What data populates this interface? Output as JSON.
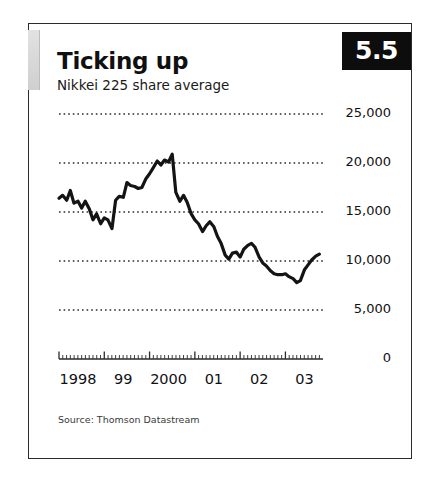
{
  "figure": {
    "badge": "5.5",
    "title": "Ticking up",
    "subtitle": "Nikkei 225 share average",
    "source": "Source: Thomson Datastream"
  },
  "chart_data": {
    "type": "line",
    "title": "Ticking up",
    "subtitle": "Nikkei 225 share average",
    "xlabel": "",
    "ylabel": "",
    "source": "Thomson Datastream",
    "grid": true,
    "legend": false,
    "xlim": [
      1998.0,
      2003.83
    ],
    "ylim": [
      0,
      25000
    ],
    "y_ticks": [
      0,
      5000,
      10000,
      15000,
      20000,
      25000
    ],
    "y_tick_labels": [
      "0",
      "5,000",
      "10,000",
      "15,000",
      "20,000",
      "25,000"
    ],
    "x_ticks": [
      1998,
      1999,
      2000,
      2001,
      2002,
      2003
    ],
    "x_tick_labels": [
      "1998",
      "99",
      "2000",
      "01",
      "02",
      "03"
    ],
    "x_minor_ticks_per_year": 12,
    "line_color": "#141414",
    "line_width": 3.2,
    "series": [
      {
        "name": "Nikkei 225 share average",
        "x": [
          1998.0,
          1998.08,
          1998.17,
          1998.25,
          1998.33,
          1998.42,
          1998.5,
          1998.58,
          1998.67,
          1998.75,
          1998.83,
          1998.92,
          1999.0,
          1999.08,
          1999.17,
          1999.25,
          1999.33,
          1999.42,
          1999.5,
          1999.58,
          1999.67,
          1999.75,
          1999.83,
          1999.92,
          2000.0,
          2000.08,
          2000.17,
          2000.25,
          2000.33,
          2000.42,
          2000.5,
          2000.58,
          2000.67,
          2000.75,
          2000.83,
          2000.92,
          2001.0,
          2001.08,
          2001.17,
          2001.25,
          2001.33,
          2001.42,
          2001.5,
          2001.58,
          2001.67,
          2001.75,
          2001.83,
          2001.92,
          2002.0,
          2002.08,
          2002.17,
          2002.25,
          2002.33,
          2002.42,
          2002.5,
          2002.58,
          2002.67,
          2002.75,
          2002.83,
          2002.92,
          2003.0,
          2003.08,
          2003.17,
          2003.25,
          2003.33,
          2003.42,
          2003.5,
          2003.58,
          2003.67,
          2003.75
        ],
        "y": [
          16400,
          16700,
          16200,
          17200,
          15900,
          16100,
          15400,
          16100,
          15300,
          14200,
          14800,
          13800,
          14400,
          14200,
          13300,
          16200,
          16600,
          16500,
          18000,
          17700,
          17600,
          17400,
          17500,
          18400,
          18900,
          19500,
          20200,
          19800,
          20300,
          20100,
          20900,
          17000,
          16100,
          16700,
          16000,
          14800,
          14200,
          13800,
          13000,
          13600,
          14000,
          13500,
          12500,
          11800,
          10600,
          10200,
          10800,
          10900,
          10400,
          11200,
          11600,
          11800,
          11400,
          10400,
          9800,
          9500,
          9000,
          8700,
          8600,
          8600,
          8700,
          8400,
          8200,
          7800,
          8000,
          9100,
          9600,
          10100,
          10500,
          10700
        ]
      }
    ]
  },
  "plot_geometry": {
    "x_left": 30,
    "x_right": 294,
    "y_top": 90,
    "y_bottom": 335
  }
}
